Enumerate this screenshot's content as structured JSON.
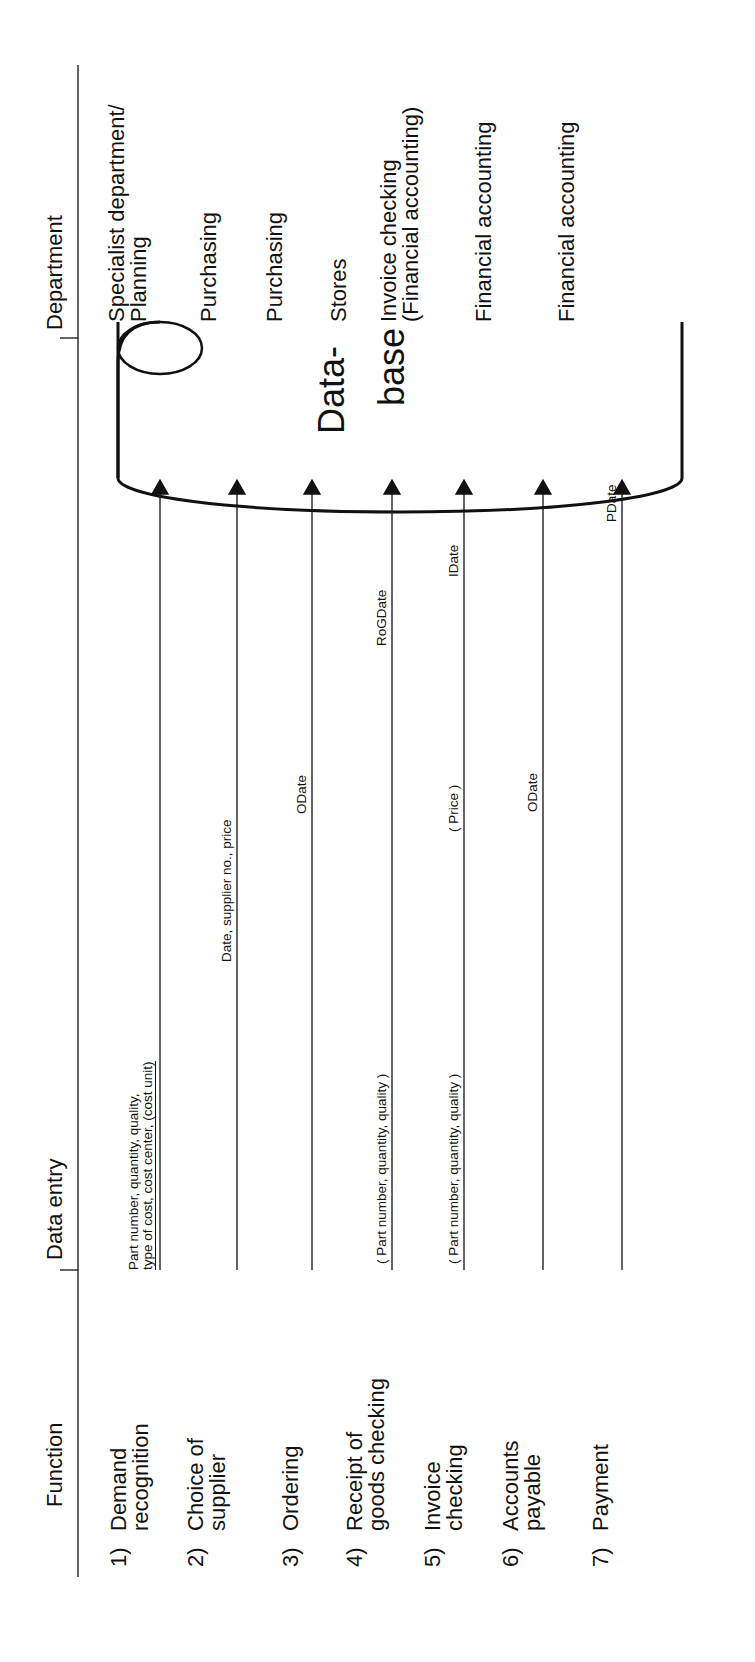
{
  "headers": {
    "function": "Function",
    "data_entry": "Data entry",
    "department": "Department"
  },
  "database": {
    "line1": "Data-",
    "line2": "base"
  },
  "rows": [
    {
      "num": "1)",
      "function_line1": "Demand",
      "function_line2": "recognition",
      "entry_line1": "Part number, quantity, quality,",
      "entry_line2": "type of cost, cost center, (cost unit)",
      "department_line1": "Specialist department/",
      "department_line2": "Planning"
    },
    {
      "num": "2)",
      "function_line1": "Choice of",
      "function_line2": "supplier",
      "entry": "Date, supplier no., price",
      "department_line1": "Purchasing"
    },
    {
      "num": "3)",
      "function_line1": "Ordering",
      "entry": "ODate",
      "department_line1": "Purchasing"
    },
    {
      "num": "4)",
      "function_line1": "Receipt of",
      "function_line2": "goods checking",
      "entry_a": "( Part number, quantity, quality )",
      "entry_b": "RoGDate",
      "department_line1": "Stores"
    },
    {
      "num": "5)",
      "function_line1": "Invoice",
      "function_line2": "checking",
      "entry_a": "( Part number, quantity, quality )",
      "entry_b": "( Price )",
      "entry_c": "IDate",
      "department_line1": "Invoice checking",
      "department_line2": "(Financial accounting)"
    },
    {
      "num": "6)",
      "function_line1": "Accounts",
      "function_line2": "payable",
      "entry": "ODate",
      "department_line1": "Financial accounting"
    },
    {
      "num": "7)",
      "function_line1": "Payment",
      "entry": "PDate",
      "department_line1": "Financial accounting"
    }
  ],
  "colors": {
    "ink": "#111111",
    "background": "#ffffff"
  }
}
